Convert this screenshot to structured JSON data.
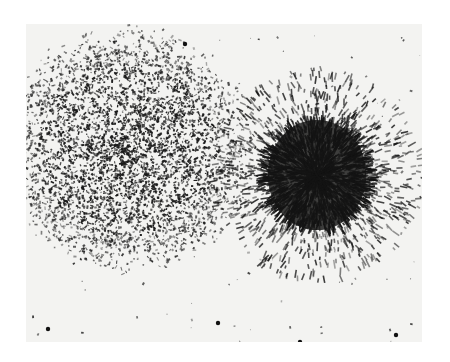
{
  "image": {
    "kind": "grayscale micrograph",
    "description": "Two cell colonies side by side: a diffuse granular colony on the left and a dense radiating spindle-cell colony on the right",
    "page_background": "#ffffff",
    "photo_background": "#f3f3f1",
    "ink_color": "#1a1a1a",
    "photo_bounds": {
      "x": 26,
      "y": 24,
      "width": 396,
      "height": 318
    }
  },
  "colonies": [
    {
      "name": "left-colony",
      "style": "granular",
      "center": [
        128,
        150
      ],
      "radius": 118,
      "count": 4200,
      "seed": 7
    },
    {
      "name": "right-colony",
      "style": "radiating",
      "center": [
        317,
        175
      ],
      "radius": 95,
      "core_radius": 58,
      "count": 2600,
      "seed": 13
    }
  ],
  "debris": {
    "count": 140,
    "seed": 29
  }
}
